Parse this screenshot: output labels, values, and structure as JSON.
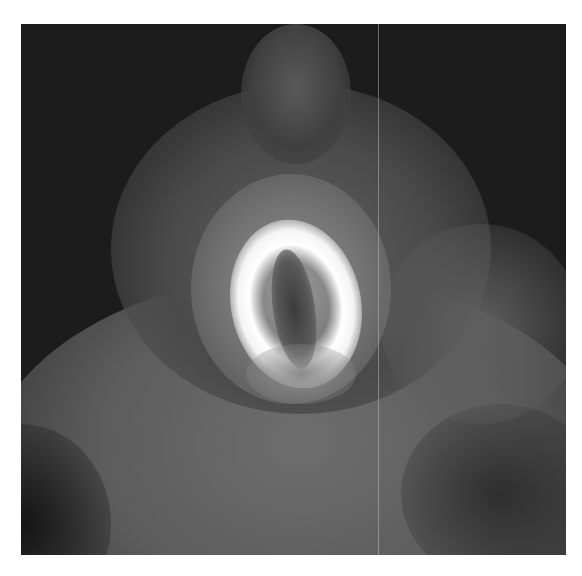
{
  "image": {
    "description": "Grayscale nuclear medicine cardiac scan showing bright horseshoe-shaped left ventricular myocardium uptake",
    "colors": {
      "background": "#ffffff",
      "scan_dark": "#1c1c1c",
      "tissue_gray": "#6a6a6a",
      "hot_uptake": "#ffffff"
    }
  }
}
